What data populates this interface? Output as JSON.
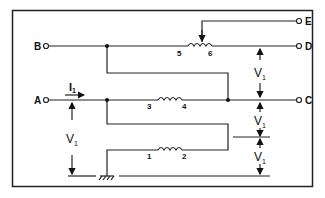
{
  "diagram": {
    "type": "autotransformer-circuit",
    "terminals": [
      {
        "id": "A",
        "label": "A"
      },
      {
        "id": "B",
        "label": "B"
      },
      {
        "id": "C",
        "label": "C"
      },
      {
        "id": "D",
        "label": "D"
      },
      {
        "id": "E",
        "label": "E"
      }
    ],
    "windings": [
      {
        "label_left": "1",
        "label_right": "2"
      },
      {
        "label_left": "3",
        "label_right": "4"
      },
      {
        "label_left": "5",
        "label_right": "6"
      }
    ],
    "current_label": "I",
    "current_subscript": "1",
    "voltage_label": "V",
    "voltage_subscript": "1"
  }
}
